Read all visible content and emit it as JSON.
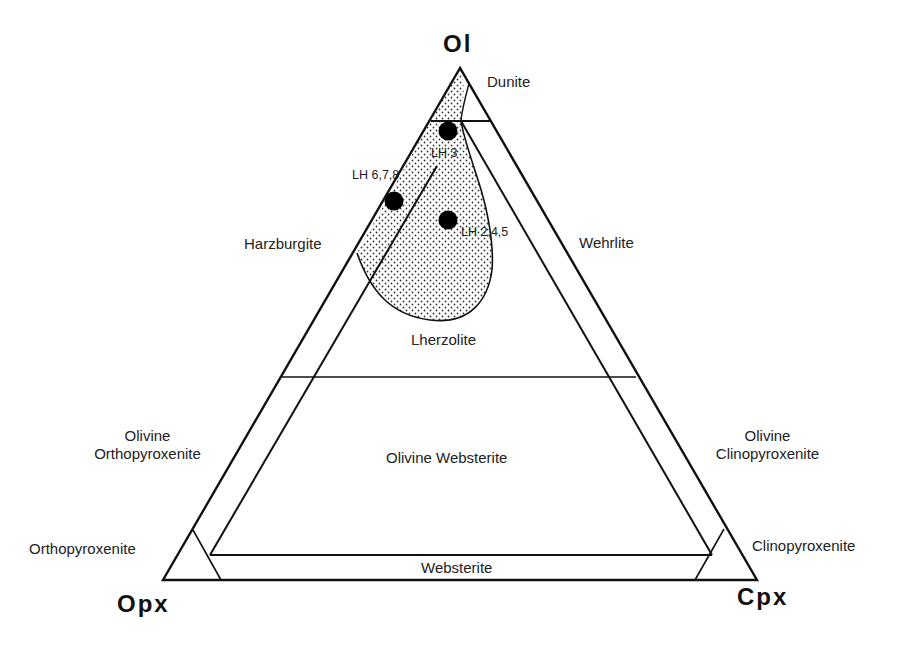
{
  "diagram": {
    "type": "ternary",
    "apices": {
      "top": "Ol",
      "bottom_left": "Opx",
      "bottom_right": "Cpx"
    },
    "fields": {
      "dunite": "Dunite",
      "harzburgite": "Harzburgite",
      "wehrlite": "Wehrlite",
      "lherzolite": "Lherzolite",
      "olivine_websterite": "Olivine Websterite",
      "olivine_orthopyroxenite_1": "Olivine",
      "olivine_orthopyroxenite_2": "Orthopyroxenite",
      "olivine_clinopyroxenite_1": "Olivine",
      "olivine_clinopyroxenite_2": "Clinopyroxenite",
      "orthopyroxenite": "Orthopyroxenite",
      "clinopyroxenite": "Clinopyroxenite",
      "websterite": "Websterite"
    },
    "samples": [
      {
        "label": "LH 3",
        "x": 448,
        "y": 131
      },
      {
        "label": "LH 6,7,8",
        "x": 394,
        "y": 201
      },
      {
        "label": "LH 2,4,5",
        "x": 448,
        "y": 220
      }
    ],
    "shaded_region": "stippled field (mantle peridotite range)",
    "colors": {
      "line": "#111111",
      "fill": "#ffffff",
      "stipple": "#333333"
    }
  }
}
